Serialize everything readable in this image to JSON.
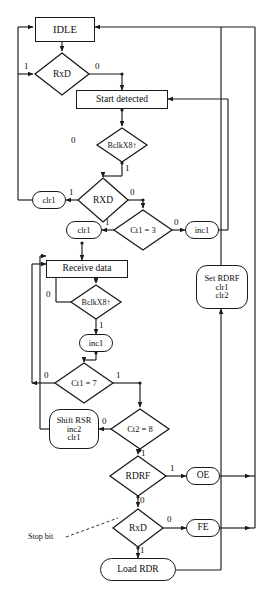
{
  "diagram": {
    "type": "flowchart",
    "stroke_color": "#1a1a1a",
    "background": "#ffffff"
  },
  "nodes": {
    "idle": {
      "label": "IDLE",
      "shape": "rect"
    },
    "rxd_top": {
      "label": "RxD",
      "shape": "diamond"
    },
    "start_detected": {
      "label": "Start detected",
      "shape": "rect"
    },
    "bclk1": {
      "label": "BclkX8↑",
      "shape": "diamond"
    },
    "clr1_a": {
      "label": "clr1",
      "shape": "oval"
    },
    "rxd_mid": {
      "label": "RXD",
      "shape": "diamond"
    },
    "clr1_b": {
      "label": "clr1",
      "shape": "oval"
    },
    "ct1_3": {
      "label": "Ct1 = 3",
      "shape": "diamond"
    },
    "inc1_a": {
      "label": "inc1",
      "shape": "oval"
    },
    "receive_data": {
      "label": "Receive data",
      "shape": "rect"
    },
    "bclk2": {
      "label": "BclkX8↑",
      "shape": "diamond"
    },
    "inc1_b": {
      "label": "inc1",
      "shape": "oval"
    },
    "ct1_7": {
      "label": "Ct1 = 7",
      "shape": "diamond"
    },
    "shift_rsr": {
      "label": "Shift RSR",
      "line2": "inc2",
      "line3": "clr1",
      "shape": "rrect"
    },
    "ct2_8": {
      "label": "Ct2 = 8",
      "shape": "diamond"
    },
    "rdrf": {
      "label": "RDRF",
      "shape": "diamond"
    },
    "oe": {
      "label": "OE",
      "shape": "oval"
    },
    "rxd_bot": {
      "label": "RxD",
      "shape": "diamond"
    },
    "fe": {
      "label": "FE",
      "shape": "oval"
    },
    "load_rdr": {
      "label": "Load RDR",
      "shape": "oval"
    },
    "set_rdrf": {
      "label": "Set RDRF",
      "line2": "clr1",
      "line3": "clr2",
      "shape": "rrect"
    }
  },
  "edge_labels": {
    "rxd_top_1": "1",
    "rxd_top_0": "0",
    "bclk1_0": "0",
    "bclk1_1": "1",
    "rxd_mid_1": "1",
    "rxd_mid_0": "0",
    "ct1_3_1": "1",
    "ct1_3_0": "0",
    "bclk2_0": "0",
    "bclk2_1": "1",
    "ct1_7_0": "0",
    "ct1_7_1": "1",
    "ct2_8_0": "0",
    "ct2_8_1": "1",
    "rdrf_1": "1",
    "rdrf_0": "0",
    "rxd_bot_0": "0",
    "rxd_bot_1": "1"
  },
  "annotations": {
    "stop_bit": "Stop bit"
  }
}
